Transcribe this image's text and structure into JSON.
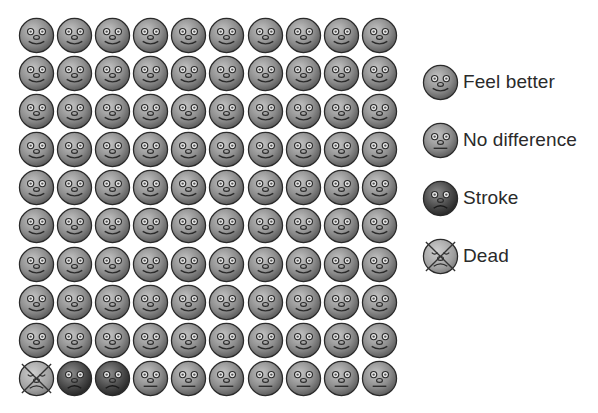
{
  "chart_data": {
    "type": "icon-array",
    "title": "",
    "rows": 10,
    "cols": 10,
    "total": 100,
    "categories": [
      "Feel better",
      "No difference",
      "Stroke",
      "Dead"
    ],
    "values": [
      90,
      7,
      2,
      1
    ],
    "order_from_bottom_left": [
      "Dead",
      "Stroke",
      "Stroke",
      "No difference x7",
      "Feel better x90"
    ],
    "grid": [
      [
        "feel_better",
        "feel_better",
        "feel_better",
        "feel_better",
        "feel_better",
        "feel_better",
        "feel_better",
        "feel_better",
        "feel_better",
        "feel_better"
      ],
      [
        "feel_better",
        "feel_better",
        "feel_better",
        "feel_better",
        "feel_better",
        "feel_better",
        "feel_better",
        "feel_better",
        "feel_better",
        "feel_better"
      ],
      [
        "feel_better",
        "feel_better",
        "feel_better",
        "feel_better",
        "feel_better",
        "feel_better",
        "feel_better",
        "feel_better",
        "feel_better",
        "feel_better"
      ],
      [
        "feel_better",
        "feel_better",
        "feel_better",
        "feel_better",
        "feel_better",
        "feel_better",
        "feel_better",
        "feel_better",
        "feel_better",
        "feel_better"
      ],
      [
        "feel_better",
        "feel_better",
        "feel_better",
        "feel_better",
        "feel_better",
        "feel_better",
        "feel_better",
        "feel_better",
        "feel_better",
        "feel_better"
      ],
      [
        "feel_better",
        "feel_better",
        "feel_better",
        "feel_better",
        "feel_better",
        "feel_better",
        "feel_better",
        "feel_better",
        "feel_better",
        "feel_better"
      ],
      [
        "feel_better",
        "feel_better",
        "feel_better",
        "feel_better",
        "feel_better",
        "feel_better",
        "feel_better",
        "feel_better",
        "feel_better",
        "feel_better"
      ],
      [
        "feel_better",
        "feel_better",
        "feel_better",
        "feel_better",
        "feel_better",
        "feel_better",
        "feel_better",
        "feel_better",
        "feel_better",
        "feel_better"
      ],
      [
        "feel_better",
        "feel_better",
        "feel_better",
        "feel_better",
        "feel_better",
        "feel_better",
        "feel_better",
        "feel_better",
        "feel_better",
        "feel_better"
      ],
      [
        "dead",
        "stroke",
        "stroke",
        "no_difference",
        "no_difference",
        "no_difference",
        "no_difference",
        "no_difference",
        "no_difference",
        "no_difference"
      ]
    ],
    "legend": [
      {
        "key": "feel_better",
        "label": "Feel better",
        "icon": "smiling-face-icon"
      },
      {
        "key": "no_difference",
        "label": "No difference",
        "icon": "neutral-face-icon"
      },
      {
        "key": "stroke",
        "label": "Stroke",
        "icon": "frowning-dark-face-icon"
      },
      {
        "key": "dead",
        "label": "Dead",
        "icon": "crossed-out-face-icon"
      }
    ],
    "legend_position": "right",
    "grid_lines": false
  },
  "colors": {
    "face_light": "#b4b4b4",
    "face_mid": "#7a7a7a",
    "face_dark_light": "#8a8a8a",
    "face_dark_mid": "#3c3c3c",
    "dead_face": "#a8a8a8",
    "outline": "#2a2a2a",
    "text": "#2a2a2a"
  }
}
